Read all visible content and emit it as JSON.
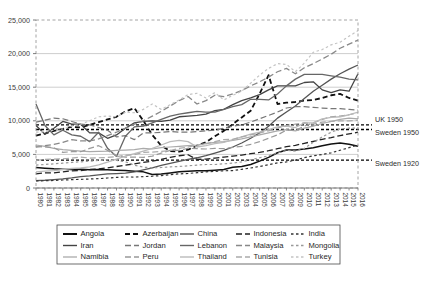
{
  "chart_data": {
    "type": "line",
    "title": "",
    "xlabel": "",
    "ylabel": "",
    "ylim": [
      0,
      25000
    ],
    "ytick_labels": [
      "0",
      "5,000",
      "10,000",
      "15,000",
      "20,000",
      "25,000"
    ],
    "ytick_values": [
      0,
      5000,
      10000,
      15000,
      20000,
      25000
    ],
    "grid": true,
    "legend_position": "bottom",
    "x": [
      1980,
      1981,
      1982,
      1983,
      1984,
      1985,
      1986,
      1987,
      1988,
      1989,
      1990,
      1991,
      1992,
      1993,
      1994,
      1995,
      1996,
      1997,
      1998,
      1999,
      2000,
      2001,
      2002,
      2003,
      2004,
      2005,
      2006,
      2007,
      2008,
      2009,
      2010,
      2011,
      2012,
      2013,
      2014,
      2015,
      2016
    ],
    "xtick_labels": [
      "1980",
      "1981",
      "1982",
      "1983",
      "1984",
      "1985",
      "1986",
      "1987",
      "1988",
      "1989",
      "1990",
      "1991",
      "1992",
      "1993",
      "1994",
      "1995",
      "1996",
      "1997",
      "1998",
      "1999",
      "2000",
      "2001",
      "2002",
      "2003",
      "2004",
      "2005",
      "2006",
      "2007",
      "2008",
      "2009",
      "2010",
      "2011",
      "2012",
      "2013",
      "2014",
      "2015",
      "2016"
    ],
    "reference_lines": [
      {
        "name": "UK 1950",
        "value": 9400,
        "color": "#000000",
        "dash": "3,2",
        "width": 1.4
      },
      {
        "name": "Sweden 1950",
        "value": 8700,
        "color": "#000000",
        "dash": "3,2",
        "width": 1.4
      },
      {
        "name": "Sweden 1920",
        "value": 4150,
        "color": "#000000",
        "dash": "3,2",
        "width": 1.2
      }
    ],
    "series": [
      {
        "name": "Angola",
        "color": "#111111",
        "dash": "none",
        "width": 1.5,
        "values": [
          3050,
          2950,
          2850,
          2800,
          2750,
          2800,
          2700,
          2750,
          2700,
          2650,
          2600,
          2500,
          2400,
          2000,
          2100,
          2250,
          2400,
          2500,
          2550,
          2550,
          2650,
          2750,
          3100,
          3200,
          3500,
          4000,
          4550,
          5250,
          5650,
          5650,
          5800,
          6000,
          6300,
          6550,
          6700,
          6500,
          6200
        ]
      },
      {
        "name": "Azerbaijan",
        "color": "#111111",
        "dash": "5,3",
        "width": 1.8,
        "values": [
          7800,
          8100,
          8500,
          8800,
          9100,
          9000,
          9400,
          9800,
          10200,
          10600,
          11400,
          11900,
          10000,
          7900,
          6300,
          5500,
          5400,
          5700,
          6300,
          6800,
          7700,
          8500,
          9500,
          10500,
          11500,
          14000,
          16800,
          12500,
          12700,
          12800,
          13000,
          13100,
          13400,
          13800,
          14000,
          13400,
          13000
        ]
      },
      {
        "name": "China",
        "color": "#555555",
        "dash": "none",
        "width": 1.3,
        "values": [
          1100,
          1150,
          1250,
          1350,
          1500,
          1700,
          1800,
          1950,
          2100,
          2150,
          2200,
          2400,
          2700,
          3000,
          3350,
          3650,
          3950,
          4250,
          4500,
          4800,
          5200,
          5600,
          6100,
          6700,
          7400,
          8200,
          9200,
          10400,
          11300,
          12200,
          13300,
          14400,
          15300,
          16200,
          17000,
          17700,
          18300
        ]
      },
      {
        "name": "Indonesia",
        "color": "#222222",
        "dash": "6,3",
        "width": 1.3,
        "values": [
          2100,
          2250,
          2250,
          2400,
          2550,
          2600,
          2750,
          2850,
          3000,
          3200,
          3400,
          3600,
          3800,
          4000,
          4250,
          4550,
          4800,
          4950,
          4250,
          4300,
          4450,
          4600,
          4750,
          4900,
          5100,
          5300,
          5550,
          5850,
          6150,
          6350,
          6650,
          6950,
          7250,
          7500,
          7800,
          8050,
          8300
        ]
      },
      {
        "name": "India",
        "color": "#333333",
        "dash": "2.5,2.5",
        "width": 1.2,
        "values": [
          1050,
          1080,
          1120,
          1190,
          1240,
          1290,
          1340,
          1390,
          1490,
          1570,
          1640,
          1630,
          1690,
          1750,
          1850,
          1970,
          2100,
          2160,
          2280,
          2410,
          2470,
          2560,
          2600,
          2780,
          2980,
          3210,
          3470,
          3750,
          3880,
          4150,
          4530,
          4790,
          4980,
          5240,
          5620,
          6000,
          6400
        ]
      },
      {
        "name": "Iran",
        "color": "#444444",
        "dash": "none",
        "width": 1.3,
        "values": [
          9300,
          8000,
          8900,
          9900,
          9500,
          9500,
          8200,
          8200,
          7400,
          7900,
          8900,
          9700,
          9900,
          10000,
          9900,
          10100,
          10600,
          10700,
          10800,
          11000,
          11500,
          11700,
          12400,
          13000,
          13400,
          13900,
          14600,
          15200,
          15200,
          15200,
          15700,
          15800,
          14600,
          14200,
          14600,
          14400,
          17000
        ]
      },
      {
        "name": "Jordan",
        "color": "#777777",
        "dash": "6,3",
        "width": 1.2,
        "values": [
          9800,
          10100,
          10400,
          10300,
          9900,
          9500,
          9400,
          9000,
          8600,
          7600,
          7800,
          7200,
          8200,
          8200,
          8300,
          8400,
          8300,
          8300,
          8400,
          8500,
          8600,
          8900,
          9200,
          9400,
          9800,
          10300,
          10800,
          11300,
          11900,
          12100,
          12100,
          12000,
          11900,
          11800,
          11800,
          11700,
          11600
        ]
      },
      {
        "name": "Lebanon",
        "color": "#666666",
        "dash": "none",
        "width": 1.3,
        "values": [
          12500,
          9300,
          7900,
          8600,
          7900,
          7700,
          6900,
          8300,
          5900,
          4700,
          7700,
          9100,
          9200,
          9700,
          10200,
          10700,
          11000,
          11200,
          11400,
          11300,
          11300,
          11700,
          12100,
          12400,
          13200,
          13200,
          13100,
          14000,
          15200,
          16200,
          16900,
          16900,
          16900,
          16700,
          16500,
          16200,
          16100
        ]
      },
      {
        "name": "Malaysia",
        "color": "#888888",
        "dash": "6,3",
        "width": 1.3,
        "values": [
          6100,
          6300,
          6500,
          6800,
          7200,
          7000,
          7000,
          7300,
          7800,
          8300,
          8900,
          9500,
          10000,
          10700,
          11400,
          12200,
          13000,
          13600,
          12500,
          13000,
          13800,
          13600,
          14000,
          14500,
          15200,
          15800,
          16500,
          17300,
          17800,
          17000,
          17900,
          18500,
          19200,
          19900,
          20800,
          21400,
          22000
        ]
      },
      {
        "name": "Mongolia",
        "color": "#999999",
        "dash": "2.5,2.5",
        "width": 1.2,
        "values": [
          3400,
          3500,
          3600,
          3700,
          3800,
          3900,
          4000,
          4100,
          4200,
          4100,
          3900,
          3400,
          3100,
          3000,
          3050,
          3150,
          3200,
          3300,
          3400,
          3500,
          3500,
          3600,
          3700,
          3900,
          4200,
          4500,
          4800,
          5200,
          5600,
          5500,
          5900,
          6800,
          7600,
          8300,
          8800,
          8900,
          8900
        ]
      },
      {
        "name": "Namibia",
        "color": "#aaaaaa",
        "dash": "none",
        "width": 1.2,
        "values": [
          6400,
          6200,
          5900,
          5700,
          5600,
          5500,
          5400,
          5450,
          5500,
          5600,
          5650,
          5700,
          5900,
          5800,
          6000,
          6100,
          6200,
          6300,
          6400,
          6600,
          6800,
          6900,
          7100,
          7300,
          7600,
          7900,
          8200,
          8500,
          8700,
          8500,
          8900,
          9200,
          9600,
          9900,
          10200,
          10400,
          10300
        ]
      },
      {
        "name": "Peru",
        "color": "#999999",
        "dash": "6,3",
        "width": 1.2,
        "values": [
          6200,
          6100,
          6000,
          5300,
          5400,
          5400,
          5900,
          6300,
          5600,
          4800,
          4600,
          4600,
          4550,
          4750,
          5200,
          5600,
          5600,
          5900,
          5850,
          5800,
          5900,
          5850,
          6050,
          6200,
          6500,
          6900,
          7400,
          7900,
          8600,
          8600,
          9200,
          9700,
          10200,
          10600,
          10700,
          10900,
          11200
        ]
      },
      {
        "name": "Thailand",
        "color": "#bbbbbb",
        "dash": "none",
        "width": 1.3,
        "values": [
          2400,
          2500,
          2600,
          2750,
          2900,
          3000,
          3150,
          3450,
          3850,
          4300,
          4750,
          5100,
          5500,
          5900,
          6400,
          6900,
          7100,
          6900,
          6100,
          6300,
          6600,
          6800,
          7200,
          7600,
          8000,
          8300,
          8700,
          9100,
          9200,
          9000,
          9700,
          9700,
          10300,
          10500,
          10600,
          10900,
          11300
        ]
      },
      {
        "name": "Tunisia",
        "color": "#aaaaaa",
        "dash": "6,3",
        "width": 1.2,
        "values": [
          4100,
          4250,
          4300,
          4350,
          4450,
          4600,
          4450,
          4500,
          4550,
          4650,
          4900,
          4950,
          5300,
          5350,
          5450,
          5550,
          5900,
          6100,
          6350,
          6600,
          6900,
          7200,
          7250,
          7600,
          7900,
          8200,
          8500,
          8900,
          9300,
          9500,
          9700,
          9500,
          9800,
          9900,
          10000,
          10000,
          10100
        ]
      },
      {
        "name": "Turkey",
        "color": "#c4c4c4",
        "dash": "2.5,2.5",
        "width": 1.2,
        "values": [
          8300,
          8400,
          8600,
          8800,
          9200,
          9500,
          10000,
          10600,
          10700,
          10600,
          11300,
          11200,
          11700,
          12500,
          11700,
          12400,
          13100,
          13900,
          14100,
          13400,
          14200,
          13100,
          13800,
          14400,
          15600,
          16800,
          17800,
          18500,
          18400,
          17300,
          18600,
          20200,
          20600,
          21300,
          21700,
          22600,
          23400
        ]
      }
    ]
  },
  "annotations": [
    {
      "label": "UK 1950",
      "value": 9400
    },
    {
      "label": "Sweden 1950",
      "value": 8700
    },
    {
      "label": "Sweden 1920",
      "value": 4150
    }
  ],
  "legend": {
    "rows": [
      [
        {
          "label": "Angola",
          "color": "#111111",
          "dash": "none",
          "width": 2.0
        },
        {
          "label": "Azerbaijan",
          "color": "#111111",
          "dash": "5,3",
          "width": 2.0
        },
        {
          "label": "China",
          "color": "#555555",
          "dash": "none",
          "width": 1.4
        },
        {
          "label": "Indonesia",
          "color": "#222222",
          "dash": "6,3",
          "width": 1.4
        },
        {
          "label": "India",
          "color": "#333333",
          "dash": "2.5,2.5",
          "width": 1.3
        }
      ],
      [
        {
          "label": "Iran",
          "color": "#444444",
          "dash": "none",
          "width": 1.4
        },
        {
          "label": "Jordan",
          "color": "#777777",
          "dash": "6,3",
          "width": 1.3
        },
        {
          "label": "Lebanon",
          "color": "#666666",
          "dash": "none",
          "width": 1.4
        },
        {
          "label": "Malaysia",
          "color": "#888888",
          "dash": "6,3",
          "width": 1.4
        },
        {
          "label": "Mongolia",
          "color": "#999999",
          "dash": "2.5,2.5",
          "width": 1.3
        }
      ],
      [
        {
          "label": "Namibia",
          "color": "#aaaaaa",
          "dash": "none",
          "width": 1.3
        },
        {
          "label": "Peru",
          "color": "#999999",
          "dash": "6,3",
          "width": 1.3
        },
        {
          "label": "Thailand",
          "color": "#bbbbbb",
          "dash": "none",
          "width": 1.4
        },
        {
          "label": "Tunisia",
          "color": "#aaaaaa",
          "dash": "6,3",
          "width": 1.3
        },
        {
          "label": "Turkey",
          "color": "#c4c4c4",
          "dash": "2.5,2.5",
          "width": 1.3
        }
      ]
    ]
  },
  "colors": {
    "plot_border": "#9a9a9a",
    "gridline": "#b9b9b9",
    "axis_text": "#3a3a3a",
    "legend_border": "#4a4a4a",
    "background": "#ffffff"
  }
}
